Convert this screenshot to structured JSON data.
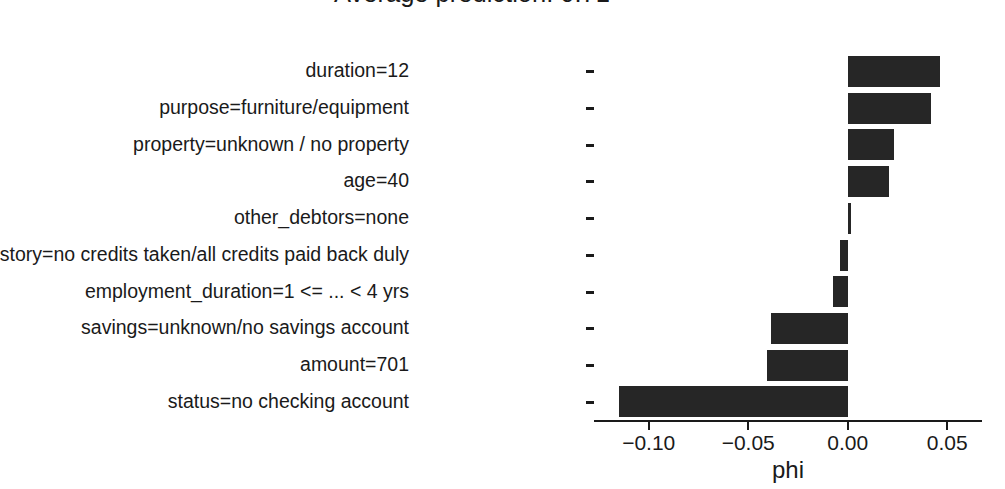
{
  "title": {
    "line1": "",
    "line2": "Average prediction: 0.71"
  },
  "axes": {
    "xlabel": "phi",
    "ylabel": "",
    "x_tick_labels": [
      "−0.10",
      "−0.05",
      "0.00",
      "0.05"
    ]
  },
  "chart_data": {
    "type": "bar",
    "orientation": "horizontal",
    "title": "Average prediction: 0.71",
    "xlabel": "phi",
    "ylabel": "",
    "xlim": [
      -0.1275,
      0.0675
    ],
    "grid": false,
    "legend": null,
    "bar_color": "#262626",
    "xticks": [
      -0.1,
      -0.05,
      0.0,
      0.05
    ],
    "xticklabels": [
      "−0.10",
      "−0.05",
      "0.00",
      "0.05"
    ],
    "categories": [
      "duration=12",
      "purpose=furniture/equipment",
      "property=unknown / no property",
      "age=40",
      "other_debtors=none",
      "credit_history=no credits taken/all credits paid back duly",
      "employment_duration=1 <= ... < 4 yrs",
      "savings=unknown/no savings account",
      "amount=701",
      "status=no checking account"
    ],
    "values": [
      0.0463,
      0.0417,
      0.0234,
      0.0209,
      0.0015,
      -0.0041,
      -0.0076,
      -0.0387,
      -0.0407,
      -0.115
    ]
  }
}
